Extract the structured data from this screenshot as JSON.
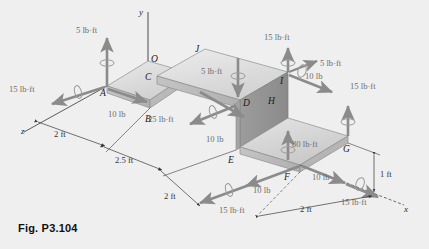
{
  "figure": {
    "caption": "Fig. P3.104",
    "background_color": "#efefef",
    "body_color_top": "#dcdcdc",
    "body_color_side": "#9a9a9a",
    "arrow_color": "#808080",
    "axis_color": "#3a3a3a"
  },
  "axes": [
    {
      "name": "y-axis",
      "label": "y"
    },
    {
      "name": "x-axis",
      "label": "x"
    },
    {
      "name": "z-axis",
      "label": "z"
    }
  ],
  "points": [
    {
      "id": "O",
      "label": "O"
    },
    {
      "id": "A",
      "label": "A"
    },
    {
      "id": "B",
      "label": "B"
    },
    {
      "id": "C",
      "label": "C"
    },
    {
      "id": "D",
      "label": "D"
    },
    {
      "id": "E",
      "label": "E"
    },
    {
      "id": "F",
      "label": "F"
    },
    {
      "id": "G",
      "label": "G"
    },
    {
      "id": "H",
      "label": "H"
    },
    {
      "id": "I",
      "label": "I"
    },
    {
      "id": "J",
      "label": "J"
    }
  ],
  "loads": [
    {
      "id": "couple-A-up",
      "label": "5 lb·ft",
      "type": "couple",
      "at": "A"
    },
    {
      "id": "couple-A-z",
      "label": "15 lb·ft",
      "type": "couple",
      "at": "A"
    },
    {
      "id": "force-A-B",
      "label": "10 lb",
      "type": "force",
      "at": "A"
    },
    {
      "id": "couple-D-down",
      "label": "5 lb·ft",
      "type": "couple",
      "at": "D"
    },
    {
      "id": "couple-D-z",
      "label": "25 lb·ft",
      "type": "couple",
      "at": "B"
    },
    {
      "id": "force-D-E",
      "label": "10 lb",
      "type": "force",
      "at": "D"
    },
    {
      "id": "couple-I-up",
      "label": "15 lb·ft",
      "type": "couple",
      "at": "I"
    },
    {
      "id": "couple-I-diag",
      "label": "5 lb·ft",
      "type": "couple",
      "at": "I"
    },
    {
      "id": "force-I-H",
      "label": "10 lb",
      "type": "force",
      "at": "I"
    },
    {
      "id": "couple-right-up",
      "label": "15 lb·ft",
      "type": "couple",
      "at": "right"
    },
    {
      "id": "couple-F-up",
      "label": "80 lb·ft",
      "type": "couple",
      "at": "F"
    },
    {
      "id": "force-F-left",
      "label": "10 lb",
      "type": "force",
      "at": "F"
    },
    {
      "id": "couple-F-z",
      "label": "15 lb·ft",
      "type": "couple",
      "at": "F"
    },
    {
      "id": "force-G-x",
      "label": "10 lb",
      "type": "force",
      "at": "G"
    },
    {
      "id": "couple-G-x",
      "label": "15 lb·ft",
      "type": "couple",
      "at": "G"
    }
  ],
  "dimensions": [
    {
      "id": "dim-2ft-left",
      "label": "2 ft"
    },
    {
      "id": "dim-2p5ft",
      "label": "2.5 ft"
    },
    {
      "id": "dim-2ft-mid",
      "label": "2 ft"
    },
    {
      "id": "dim-2ft-right",
      "label": "2 ft"
    },
    {
      "id": "dim-1ft",
      "label": "1 ft"
    }
  ]
}
